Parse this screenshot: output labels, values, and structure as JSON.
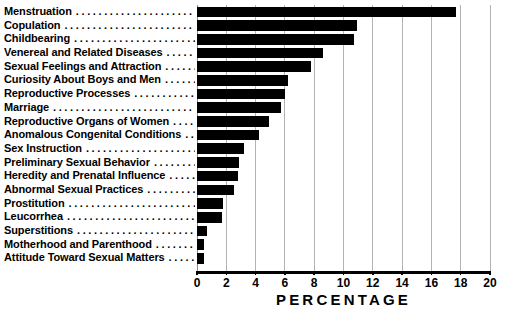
{
  "chart_data": {
    "type": "bar",
    "orientation": "horizontal",
    "title": "",
    "xlabel": "PERCENTAGE",
    "ylabel": "",
    "xlim": [
      0,
      20
    ],
    "xticks": [
      0,
      2,
      4,
      6,
      8,
      10,
      12,
      14,
      16,
      18,
      20
    ],
    "grid": true,
    "legend": null,
    "bar_color": "#000000",
    "grid_color": "#b3b3b3",
    "categories": [
      "Menstruation",
      "Copulation",
      "Childbearing",
      "Venereal and Related Diseases",
      "Sexual Feelings and Attraction",
      "Curiosity About Boys and Men",
      "Reproductive Processes",
      "Marriage",
      "Reproductive Organs of Women",
      "Anomalous Congenital Conditions",
      "Sex Instruction",
      "Preliminary Sexual Behavior",
      "Heredity and Prenatal Influence",
      "Abnormal Sexual Practices",
      "Prostitution",
      "Leucorrhea",
      "Superstitions",
      "Motherhood and Parenthood",
      "Attitude Toward Sexual Matters"
    ],
    "values": [
      17.7,
      10.9,
      10.7,
      8.6,
      7.8,
      6.2,
      6.0,
      5.7,
      4.9,
      4.2,
      3.2,
      2.9,
      2.8,
      2.5,
      1.8,
      1.7,
      0.7,
      0.5,
      0.5
    ]
  }
}
